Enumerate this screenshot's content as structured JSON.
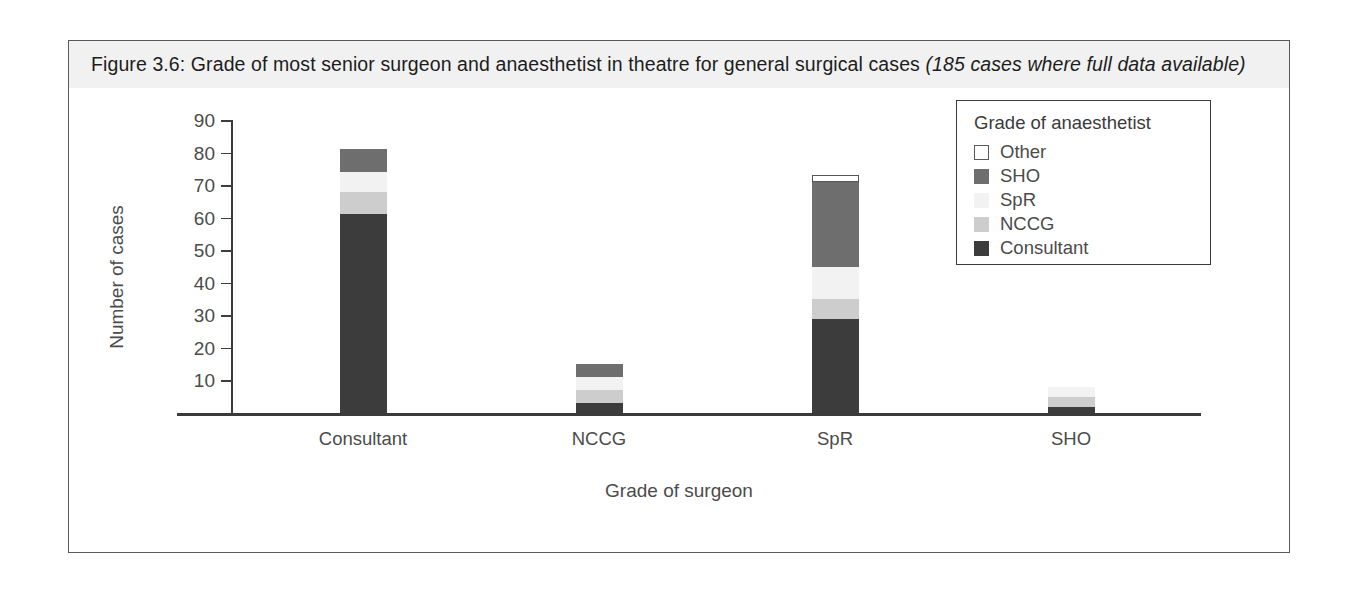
{
  "figure": {
    "title_main": "Figure 3.6: Grade of most senior surgeon and anaesthetist in theatre for general surgical cases",
    "title_italic": "(185 cases where full data available)"
  },
  "legend": {
    "title": "Grade of anaesthetist",
    "entries": [
      {
        "label": "Other",
        "color": "#ffffff",
        "border": "#5a5a5a"
      },
      {
        "label": "SHO",
        "color": "#6e6e6e",
        "border": "#6e6e6e"
      },
      {
        "label": "SpR",
        "color": "#f2f2f2",
        "border": "#f2f2f2"
      },
      {
        "label": "NCCG",
        "color": "#cdcdcd",
        "border": "#cdcdcd"
      },
      {
        "label": "Consultant",
        "color": "#3c3c3c",
        "border": "#3c3c3c"
      }
    ]
  },
  "chart_data": {
    "type": "bar",
    "stacked": true,
    "xlabel": "Grade of surgeon",
    "ylabel": "Number of cases",
    "ylim": [
      0,
      90
    ],
    "yticks": [
      10,
      20,
      30,
      40,
      50,
      60,
      70,
      80,
      90
    ],
    "grid": false,
    "legend_position": "top-right",
    "legend_title": "Grade of anaesthetist",
    "categories": [
      "Consultant",
      "NCCG",
      "SpR",
      "SHO"
    ],
    "series": [
      {
        "name": "Consultant",
        "color": "#3c3c3c",
        "values": [
          61,
          3,
          29,
          2
        ]
      },
      {
        "name": "NCCG",
        "color": "#cdcdcd",
        "values": [
          7,
          4,
          6,
          3
        ]
      },
      {
        "name": "SpR",
        "color": "#f2f2f2",
        "values": [
          6,
          4,
          10,
          3
        ]
      },
      {
        "name": "SHO",
        "color": "#6e6e6e",
        "values": [
          7,
          4,
          26,
          0
        ]
      },
      {
        "name": "Other",
        "color": "#ffffff",
        "values": [
          0,
          0,
          2,
          0
        ]
      }
    ],
    "totals": [
      81,
      15,
      73,
      8
    ]
  },
  "axes": {
    "y_tick_labels": [
      "90",
      "80",
      "70",
      "60",
      "50",
      "40",
      "30",
      "20",
      "10"
    ],
    "y_title": "Number of cases",
    "x_tick_labels": [
      "Consultant",
      "NCCG",
      "SpR",
      "SHO"
    ],
    "x_title": "Grade of surgeon"
  }
}
